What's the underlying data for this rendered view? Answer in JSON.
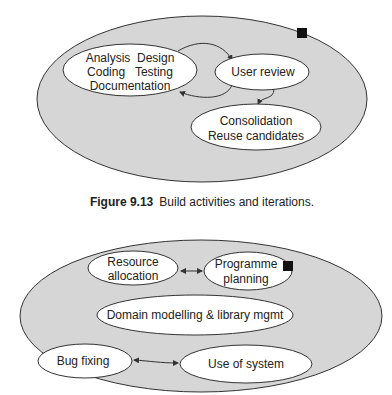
{
  "figure1": {
    "caption_number": "Figure 9.13",
    "caption_text": "Build activities and iterations.",
    "nodes": {
      "activities": [
        "Analysis  Design",
        "Coding   Testing",
        "Documentation"
      ],
      "user_review": "User review",
      "consolidation": [
        "Consolidation",
        "Reuse candidates"
      ]
    },
    "marker": "black-square"
  },
  "figure2": {
    "nodes": {
      "resource_allocation": [
        "Resource",
        "allocation"
      ],
      "programme_planning": [
        "Programme",
        "planning"
      ],
      "domain_modelling": "Domain modelling & library mgmt",
      "bug_fixing": "Bug fixing",
      "use_of_system": "Use of system"
    },
    "marker": "black-square"
  },
  "colors": {
    "outer_fill": "#d6d6d6",
    "inner_fill": "#ffffff",
    "stroke": "#333333",
    "marker": "#111111"
  }
}
